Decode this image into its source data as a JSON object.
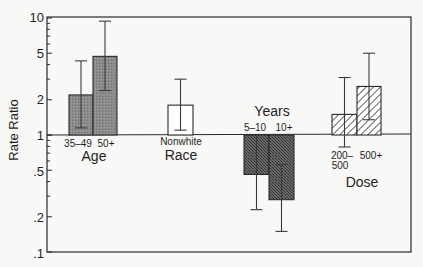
{
  "chart_data": {
    "type": "bar",
    "title": "",
    "xlabel": "",
    "ylabel": "Rate Ratio",
    "yscale": "log",
    "ylim": [
      0.1,
      10
    ],
    "baseline": 1,
    "yticks": [
      10,
      5,
      2,
      1,
      0.5,
      0.2,
      0.1
    ],
    "ytick_labels": [
      "10",
      "5",
      "2",
      "1",
      ".5",
      ".2",
      ".1"
    ],
    "grid": false,
    "legend": null,
    "groups": [
      {
        "name": "Age",
        "categories": [
          "35–49",
          "50+"
        ]
      },
      {
        "name": "Race",
        "categories": [
          "Nonwhite"
        ]
      },
      {
        "name": "Years",
        "categories": [
          "5–10",
          "10+"
        ]
      },
      {
        "name": "Dose",
        "categories": [
          "200–500",
          "500+"
        ]
      }
    ],
    "bars": [
      {
        "group": "Age",
        "label": "35–49",
        "value": 2.2,
        "ci_low": 1.15,
        "ci_high": 4.3,
        "fill": "gray-stipple"
      },
      {
        "group": "Age",
        "label": "50+",
        "value": 4.7,
        "ci_low": 2.4,
        "ci_high": 9.4,
        "fill": "gray-stipple"
      },
      {
        "group": "Race",
        "label": "Nonwhite",
        "value": 1.8,
        "ci_low": 1.1,
        "ci_high": 3.0,
        "fill": "white"
      },
      {
        "group": "Years",
        "label": "5–10",
        "value": 0.46,
        "ci_low": 0.23,
        "ci_high": 1.0,
        "fill": "dark-stipple"
      },
      {
        "group": "Years",
        "label": "10+",
        "value": 0.28,
        "ci_low": 0.15,
        "ci_high": 0.56,
        "fill": "dark-stipple"
      },
      {
        "group": "Dose",
        "label": "200–500",
        "value": 1.5,
        "ci_low": 0.79,
        "ci_high": 3.1,
        "fill": "hatched"
      },
      {
        "group": "Dose",
        "label": "500+",
        "value": 2.6,
        "ci_low": 1.35,
        "ci_high": 5.0,
        "fill": "hatched"
      }
    ],
    "labels": {
      "age_35_49": "35–49",
      "age_50": "50+",
      "age": "Age",
      "race_nonwhite": "Nonwhite",
      "race": "Race",
      "years": "Years",
      "years_5_10": "5–10",
      "years_10": "10+",
      "dose_200_line1": "200–",
      "dose_200_line2": "500",
      "dose_500": "500+",
      "dose": "Dose"
    },
    "colors": {
      "axis": "#2a2a2a",
      "gray_fill": "#8c8c8c",
      "dark_fill": "#5a5a5a",
      "white_fill": "#ffffff",
      "hatch": "#3a3a3a"
    }
  }
}
